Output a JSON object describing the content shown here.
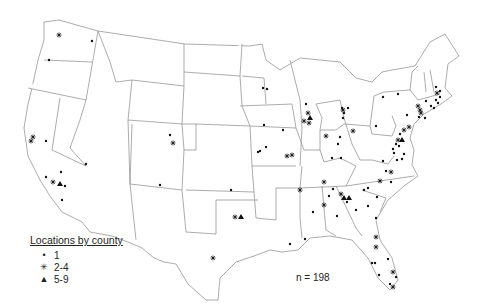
{
  "legend": {
    "title": "Locations by county",
    "items": [
      {
        "symbol": "dot",
        "glyph": "•",
        "label": "1"
      },
      {
        "symbol": "asterisk",
        "glyph": "✳",
        "label": "2-4"
      },
      {
        "symbol": "triangle",
        "glyph": "▲",
        "label": "5-9"
      }
    ]
  },
  "n_label": "n = 198",
  "colors": {
    "outline": "#888888",
    "marker": "#111111",
    "background": "#ffffff"
  },
  "markers": [
    {
      "x": 59,
      "y": 35,
      "t": "asterisk"
    },
    {
      "x": 92,
      "y": 41,
      "t": "dot"
    },
    {
      "x": 49,
      "y": 60,
      "t": "dot"
    },
    {
      "x": 33,
      "y": 137,
      "t": "asterisk"
    },
    {
      "x": 31,
      "y": 141,
      "t": "asterisk"
    },
    {
      "x": 46,
      "y": 141,
      "t": "dot"
    },
    {
      "x": 86,
      "y": 164,
      "t": "dot"
    },
    {
      "x": 61,
      "y": 172,
      "t": "dot"
    },
    {
      "x": 46,
      "y": 177,
      "t": "dot"
    },
    {
      "x": 53,
      "y": 182,
      "t": "asterisk"
    },
    {
      "x": 60,
      "y": 184,
      "t": "triangle"
    },
    {
      "x": 65,
      "y": 186,
      "t": "dot"
    },
    {
      "x": 62,
      "y": 200,
      "t": "dot"
    },
    {
      "x": 170,
      "y": 135,
      "t": "dot"
    },
    {
      "x": 173,
      "y": 143,
      "t": "asterisk"
    },
    {
      "x": 160,
      "y": 185,
      "t": "dot"
    },
    {
      "x": 231,
      "y": 190,
      "t": "dot"
    },
    {
      "x": 235,
      "y": 217,
      "t": "asterisk"
    },
    {
      "x": 241,
      "y": 217,
      "t": "triangle"
    },
    {
      "x": 213,
      "y": 258,
      "t": "asterisk"
    },
    {
      "x": 263,
      "y": 88,
      "t": "dot"
    },
    {
      "x": 267,
      "y": 89,
      "t": "dot"
    },
    {
      "x": 264,
      "y": 125,
      "t": "dot"
    },
    {
      "x": 283,
      "y": 130,
      "t": "dot"
    },
    {
      "x": 266,
      "y": 147,
      "t": "dot"
    },
    {
      "x": 260,
      "y": 151,
      "t": "dot"
    },
    {
      "x": 258,
      "y": 152,
      "t": "dot"
    },
    {
      "x": 287,
      "y": 156,
      "t": "asterisk"
    },
    {
      "x": 292,
      "y": 155,
      "t": "asterisk"
    },
    {
      "x": 306,
      "y": 104,
      "t": "dot"
    },
    {
      "x": 308,
      "y": 113,
      "t": "asterisk"
    },
    {
      "x": 310,
      "y": 118,
      "t": "triangle"
    },
    {
      "x": 304,
      "y": 121,
      "t": "asterisk"
    },
    {
      "x": 309,
      "y": 123,
      "t": "asterisk"
    },
    {
      "x": 326,
      "y": 136,
      "t": "asterisk"
    },
    {
      "x": 340,
      "y": 137,
      "t": "dot"
    },
    {
      "x": 353,
      "y": 131,
      "t": "asterisk"
    },
    {
      "x": 338,
      "y": 144,
      "t": "dot"
    },
    {
      "x": 332,
      "y": 158,
      "t": "dot"
    },
    {
      "x": 341,
      "y": 158,
      "t": "dot"
    },
    {
      "x": 342,
      "y": 108,
      "t": "dot"
    },
    {
      "x": 343,
      "y": 110,
      "t": "asterisk"
    },
    {
      "x": 348,
      "y": 108,
      "t": "dot"
    },
    {
      "x": 344,
      "y": 113,
      "t": "dot"
    },
    {
      "x": 343,
      "y": 118,
      "t": "dot"
    },
    {
      "x": 383,
      "y": 97,
      "t": "dot"
    },
    {
      "x": 398,
      "y": 94,
      "t": "dot"
    },
    {
      "x": 376,
      "y": 126,
      "t": "dot"
    },
    {
      "x": 407,
      "y": 115,
      "t": "dot"
    },
    {
      "x": 409,
      "y": 127,
      "t": "asterisk"
    },
    {
      "x": 404,
      "y": 130,
      "t": "asterisk"
    },
    {
      "x": 400,
      "y": 134,
      "t": "dot"
    },
    {
      "x": 398,
      "y": 140,
      "t": "asterisk"
    },
    {
      "x": 402,
      "y": 140,
      "t": "triangle"
    },
    {
      "x": 396,
      "y": 144,
      "t": "dot"
    },
    {
      "x": 393,
      "y": 149,
      "t": "dot"
    },
    {
      "x": 399,
      "y": 146,
      "t": "dot"
    },
    {
      "x": 404,
      "y": 154,
      "t": "dot"
    },
    {
      "x": 418,
      "y": 106,
      "t": "asterisk"
    },
    {
      "x": 420,
      "y": 110,
      "t": "asterisk"
    },
    {
      "x": 421,
      "y": 113,
      "t": "asterisk"
    },
    {
      "x": 419,
      "y": 117,
      "t": "dot"
    },
    {
      "x": 425,
      "y": 118,
      "t": "dot"
    },
    {
      "x": 431,
      "y": 106,
      "t": "dot"
    },
    {
      "x": 434,
      "y": 108,
      "t": "dot"
    },
    {
      "x": 436,
      "y": 100,
      "t": "dot"
    },
    {
      "x": 438,
      "y": 103,
      "t": "dot"
    },
    {
      "x": 437,
      "y": 93,
      "t": "asterisk"
    },
    {
      "x": 440,
      "y": 91,
      "t": "dot"
    },
    {
      "x": 440,
      "y": 97,
      "t": "dot"
    },
    {
      "x": 436,
      "y": 87,
      "t": "dot"
    },
    {
      "x": 426,
      "y": 101,
      "t": "dot"
    },
    {
      "x": 383,
      "y": 161,
      "t": "dot"
    },
    {
      "x": 394,
      "y": 153,
      "t": "dot"
    },
    {
      "x": 397,
      "y": 160,
      "t": "dot"
    },
    {
      "x": 402,
      "y": 159,
      "t": "dot"
    },
    {
      "x": 386,
      "y": 171,
      "t": "dot"
    },
    {
      "x": 391,
      "y": 172,
      "t": "asterisk"
    },
    {
      "x": 380,
      "y": 181,
      "t": "asterisk"
    },
    {
      "x": 391,
      "y": 182,
      "t": "dot"
    },
    {
      "x": 324,
      "y": 182,
      "t": "asterisk"
    },
    {
      "x": 300,
      "y": 190,
      "t": "asterisk"
    },
    {
      "x": 333,
      "y": 189,
      "t": "dot"
    },
    {
      "x": 329,
      "y": 196,
      "t": "dot"
    },
    {
      "x": 341,
      "y": 194,
      "t": "asterisk"
    },
    {
      "x": 344,
      "y": 198,
      "t": "triangle"
    },
    {
      "x": 349,
      "y": 198,
      "t": "triangle"
    },
    {
      "x": 347,
      "y": 202,
      "t": "dot"
    },
    {
      "x": 324,
      "y": 205,
      "t": "asterisk"
    },
    {
      "x": 313,
      "y": 212,
      "t": "dot"
    },
    {
      "x": 356,
      "y": 210,
      "t": "dot"
    },
    {
      "x": 337,
      "y": 216,
      "t": "dot"
    },
    {
      "x": 364,
      "y": 190,
      "t": "dot"
    },
    {
      "x": 368,
      "y": 188,
      "t": "dot"
    },
    {
      "x": 377,
      "y": 197,
      "t": "dot"
    },
    {
      "x": 368,
      "y": 206,
      "t": "dot"
    },
    {
      "x": 376,
      "y": 218,
      "t": "dot"
    },
    {
      "x": 290,
      "y": 244,
      "t": "dot"
    },
    {
      "x": 305,
      "y": 239,
      "t": "dot"
    },
    {
      "x": 376,
      "y": 237,
      "t": "asterisk"
    },
    {
      "x": 376,
      "y": 247,
      "t": "asterisk"
    },
    {
      "x": 388,
      "y": 259,
      "t": "dot"
    },
    {
      "x": 372,
      "y": 263,
      "t": "dot"
    },
    {
      "x": 375,
      "y": 263,
      "t": "dot"
    },
    {
      "x": 393,
      "y": 272,
      "t": "asterisk"
    },
    {
      "x": 396,
      "y": 277,
      "t": "dot"
    },
    {
      "x": 379,
      "y": 275,
      "t": "dot"
    },
    {
      "x": 390,
      "y": 284,
      "t": "dot"
    },
    {
      "x": 393,
      "y": 287,
      "t": "asterisk"
    }
  ]
}
